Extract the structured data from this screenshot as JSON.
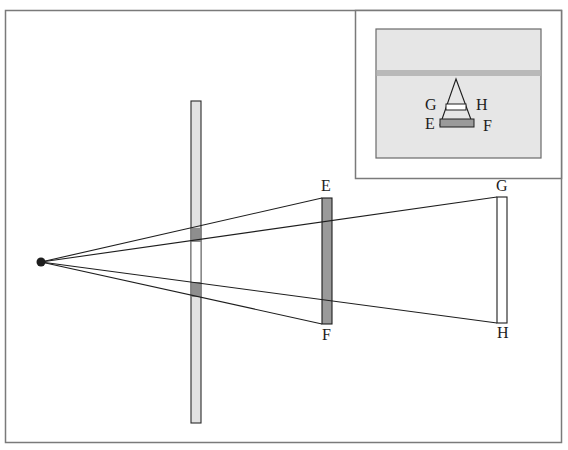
{
  "diagram": {
    "type": "perspective-occlusion-diagram",
    "colors": {
      "frame": "#7a7a7a",
      "line": "#1e1e1e",
      "screen_fill": "#e2e2e2",
      "occluded_fill": "#8e8e8e",
      "object_fill": "#9a9a9a",
      "inset_fill": "#e6e6e6",
      "inset_band": "#b9b9b9",
      "white": "#ffffff"
    },
    "eye_point": {
      "x": 41,
      "y": 262
    },
    "screen": {
      "x": 191,
      "y": 101,
      "width": 10,
      "height": 322
    },
    "near_object": {
      "label_top": "E",
      "label_bottom": "F",
      "x": 322,
      "y": 198,
      "width": 10,
      "height": 126
    },
    "far_object": {
      "label_top": "G",
      "label_bottom": "H",
      "x": 497,
      "y": 197,
      "width": 10,
      "height": 126
    },
    "labels": {
      "E": "E",
      "F": "F",
      "G": "G",
      "H": "H"
    },
    "inset": {
      "labels": {
        "G": "G",
        "H": "H",
        "E": "E",
        "F": "F"
      }
    }
  }
}
